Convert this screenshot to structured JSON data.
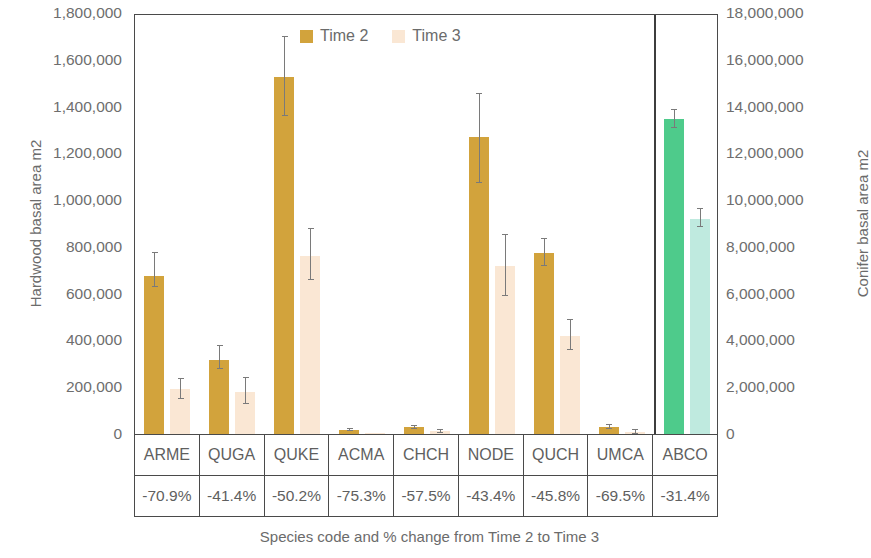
{
  "chart_data": {
    "type": "bar",
    "title": "",
    "xlabel": "Species code and % change from Time 2 to Time 3",
    "ylabel": "Hardwood basal area m2",
    "y2label": "Conifer basal area m2",
    "ylim": [
      0,
      1800000
    ],
    "y2lim": [
      0,
      18000000
    ],
    "grid": false,
    "legend_position": "top-center",
    "categories": [
      "ARME",
      "QUGA",
      "QUKE",
      "ACMA",
      "CHCH",
      "NODE",
      "QUCH",
      "UMCA",
      "ABCO"
    ],
    "percent_change": [
      "-70.9%",
      "-41.4%",
      "-50.2%",
      "-75.3%",
      "-57.5%",
      "-43.4%",
      "-45.8%",
      "-69.5%",
      "-31.4%"
    ],
    "axis_assignment": [
      "left",
      "left",
      "left",
      "left",
      "left",
      "left",
      "left",
      "left",
      "right"
    ],
    "series": [
      {
        "name": "Time 2",
        "color": "#D2A33C",
        "conifer_color": "#4ECB8B",
        "values": [
          675000,
          315000,
          1525000,
          18000,
          30000,
          1270000,
          775000,
          32000,
          13450000
        ],
        "error_low": [
          630000,
          280000,
          1360000,
          12000,
          22000,
          1075000,
          720000,
          22000,
          13100000
        ],
        "error_high": [
          780000,
          380000,
          1700000,
          26000,
          40000,
          1460000,
          840000,
          44000,
          13900000
        ]
      },
      {
        "name": "Time 3",
        "color": "#FAE7D4",
        "conifer_color": "#BFEADF",
        "values": [
          192000,
          180000,
          760000,
          4000,
          12000,
          720000,
          420000,
          10000,
          9200000
        ],
        "error_low": [
          150000,
          130000,
          660000,
          1000,
          6000,
          590000,
          360000,
          2000,
          8850000
        ],
        "error_high": [
          240000,
          245000,
          880000,
          9000,
          20000,
          855000,
          490000,
          20000,
          9650000
        ]
      }
    ],
    "y_ticks": [
      "0",
      "200,000",
      "400,000",
      "600,000",
      "800,000",
      "1,000,000",
      "1,200,000",
      "1,400,000",
      "1,600,000",
      "1,800,000"
    ],
    "y2_ticks": [
      "0",
      "2,000,000",
      "4,000,000",
      "6,000,000",
      "8,000,000",
      "10,000,000",
      "12,000,000",
      "14,000,000",
      "16,000,000",
      "18,000,000"
    ]
  }
}
